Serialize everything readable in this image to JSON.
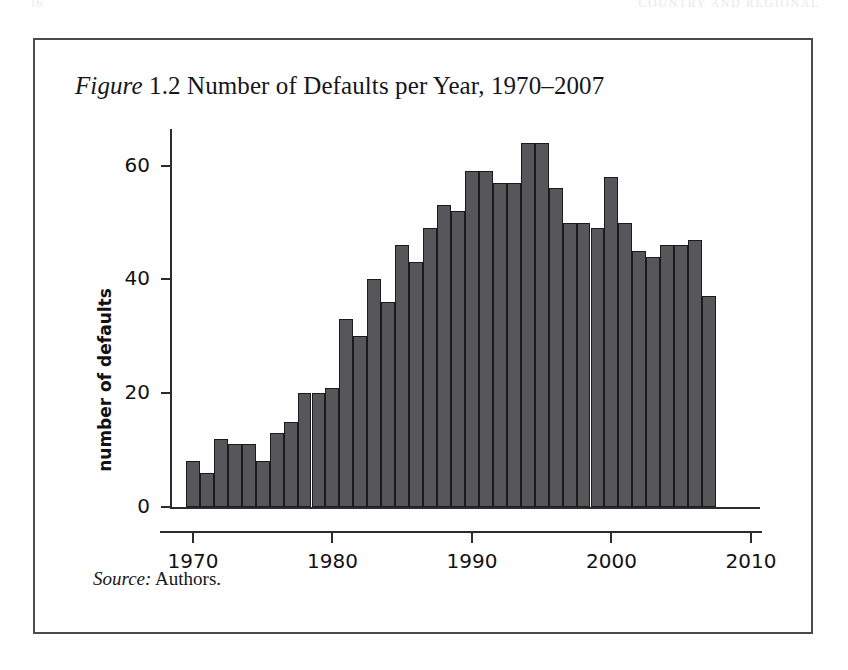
{
  "page": {
    "running_head_left": "16",
    "running_head_right": "COUNTRY AND REGIONAL"
  },
  "figure": {
    "label": "Figure",
    "number": "1.2",
    "title_rest": "Number of Defaults per Year, 1970–2007",
    "title_full": "Figure 1.2 Number of Defaults per Year, 1970–2007",
    "source_label": "Source:",
    "source_value": "Authors.",
    "frame_color": "#4a4a4f"
  },
  "chart_data": {
    "type": "bar",
    "title": "Figure 1.2 Number of Defaults per Year, 1970–2007",
    "xlabel": "",
    "ylabel": "number of defaults",
    "xlim": [
      1969,
      2011
    ],
    "ylim": [
      0,
      66
    ],
    "grid": false,
    "legend": false,
    "bar_color": "#575759",
    "bar_edge_color": "#1b1b1d",
    "y_ticks": [
      0,
      20,
      40,
      60
    ],
    "y_tick_labels": [
      "0",
      "20",
      "40",
      "60"
    ],
    "x_ticks": [
      1970,
      1980,
      1990,
      2000,
      2010
    ],
    "x_tick_labels": [
      "1970",
      "1980",
      "1990",
      "2000",
      "2010"
    ],
    "categories": [
      1970,
      1971,
      1972,
      1973,
      1974,
      1975,
      1976,
      1977,
      1978,
      1979,
      1980,
      1981,
      1982,
      1983,
      1984,
      1985,
      1986,
      1987,
      1988,
      1989,
      1990,
      1991,
      1992,
      1993,
      1994,
      1995,
      1996,
      1997,
      1998,
      1999,
      2000,
      2001,
      2002,
      2003,
      2004,
      2005,
      2006,
      2007
    ],
    "values": [
      8,
      6,
      12,
      11,
      11,
      8,
      13,
      15,
      20,
      20,
      21,
      33,
      30,
      40,
      36,
      46,
      43,
      49,
      53,
      52,
      59,
      59,
      57,
      57,
      64,
      64,
      56,
      50,
      50,
      49,
      58,
      50,
      45,
      44,
      46,
      46,
      47,
      37
    ]
  }
}
